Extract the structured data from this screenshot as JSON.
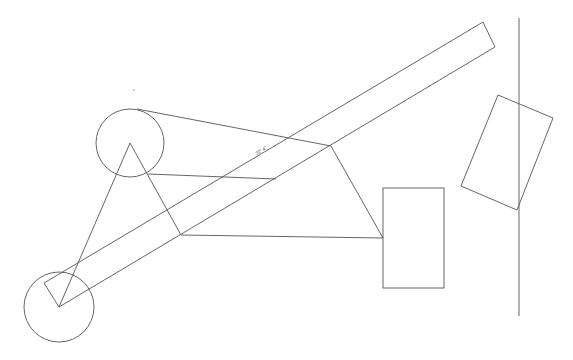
{
  "canvas": {
    "width": 573,
    "height": 360,
    "background": "#ffffff",
    "stroke_color": "#555555"
  },
  "dimension_label": {
    "text": "32' 4\"",
    "x": 262,
    "y": 152,
    "angle": -30.6
  },
  "shapes": {
    "upper_circle": {
      "cx": 130,
      "cy": 143,
      "r": 34
    },
    "lower_circle": {
      "cx": 59,
      "cy": 307,
      "r": 35
    },
    "bar": {
      "points": "44,283 483,22 495,47 59,307"
    },
    "center_rect": {
      "x": 383,
      "y": 188,
      "w": 61,
      "h": 100
    },
    "rotated_rect": {
      "points": "498,95 553,118 517,210 461,186"
    },
    "vertical_line": {
      "x1": 519,
      "y1": 18,
      "x2": 519,
      "y2": 316
    },
    "lines": [
      {
        "id": "top-tangent",
        "x1": 137,
        "y1": 109,
        "x2": 331,
        "y2": 146
      },
      {
        "id": "mid-link",
        "x1": 148,
        "y1": 174,
        "x2": 276,
        "y2": 179
      },
      {
        "id": "tri-left-leg",
        "x1": 59,
        "y1": 307,
        "x2": 130,
        "y2": 143
      },
      {
        "id": "tri-right-leg",
        "x1": 130,
        "y1": 143,
        "x2": 181,
        "y2": 235
      },
      {
        "id": "bottom-link",
        "x1": 181,
        "y1": 235,
        "x2": 383,
        "y2": 238
      },
      {
        "id": "diag-to-rect",
        "x1": 331,
        "y1": 146,
        "x2": 383,
        "y2": 238
      }
    ],
    "dots": [
      {
        "x": 134,
        "y": 90
      }
    ]
  }
}
